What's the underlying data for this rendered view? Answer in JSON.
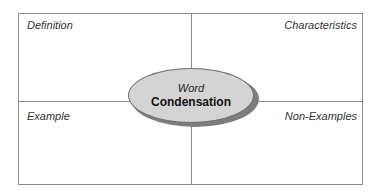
{
  "diagram": {
    "type": "frayer-model",
    "center": {
      "line1": "Word",
      "line2": "Condensation"
    },
    "quadrants": {
      "top_left": "Definition",
      "top_right": "Characteristics",
      "bottom_left": "Example",
      "bottom_right": "Non-Examples"
    },
    "colors": {
      "border": "#8a8a8a",
      "ellipse_fill": "#d4d4d4",
      "ellipse_shadow": "#7d7d7d"
    }
  }
}
